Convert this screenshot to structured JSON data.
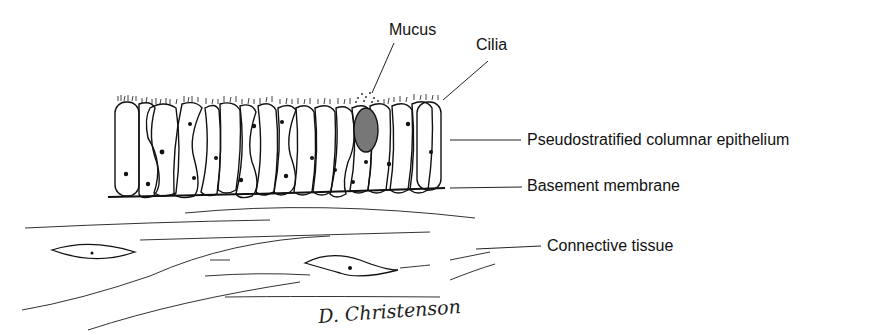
{
  "figure": {
    "labels": {
      "mucus": "Mucus",
      "cilia": "Cilia",
      "epithelium": "Pseudostratified columnar epithelium",
      "basement": "Basement membrane",
      "connective": "Connective tissue"
    },
    "signature": "D. Christenson",
    "colors": {
      "ink": "#111111",
      "background": "#ffffff",
      "mucus_fill": "#777777"
    }
  }
}
